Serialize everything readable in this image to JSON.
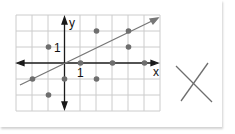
{
  "graph": {
    "x_axis_label": "x",
    "y_axis_label": "y",
    "x_unit_label": "1",
    "y_unit_label": "1",
    "grid_color": "#cccccc",
    "axis_color": "#1a1a1a",
    "point_color": "#6e6e6e",
    "line_color": "#777777",
    "points": [
      [
        -2,
        -1
      ],
      [
        -1,
        1
      ],
      [
        -1,
        -2
      ],
      [
        0,
        -1
      ],
      [
        1,
        0
      ],
      [
        2,
        2
      ],
      [
        2,
        -1
      ],
      [
        3,
        0
      ],
      [
        4,
        2
      ],
      [
        4,
        1
      ],
      [
        5,
        0
      ]
    ],
    "trend_line": {
      "slope": 0.5,
      "intercept": 0
    }
  },
  "answer_mark": {
    "symbol": "X",
    "meaning": "no correlation option"
  }
}
